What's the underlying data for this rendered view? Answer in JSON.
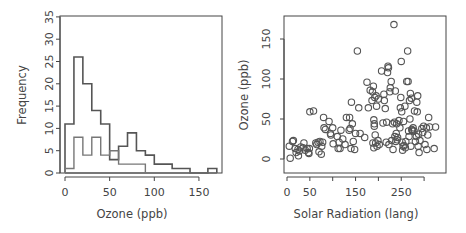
{
  "chart_data": [
    {
      "type": "bar",
      "subtype": "overlaid step histograms",
      "title": "",
      "xlabel": "Ozone (ppb)",
      "ylabel": "Frequency",
      "xlim": [
        0,
        170
      ],
      "ylim": [
        0,
        35
      ],
      "x_ticks": [
        0,
        50,
        100,
        150
      ],
      "y_ticks": [
        0,
        5,
        10,
        15,
        20,
        25,
        30,
        35
      ],
      "bin_width": 10,
      "bin_edges": [
        0,
        10,
        20,
        30,
        40,
        50,
        60,
        70,
        80,
        90,
        100,
        110,
        120,
        130,
        140,
        150,
        160,
        170
      ],
      "series": [
        {
          "name": "all",
          "color": "#555555",
          "values": [
            11,
            26,
            20,
            14,
            11,
            3,
            6,
            9,
            5,
            4,
            2,
            2,
            1,
            1,
            0,
            0,
            1
          ]
        },
        {
          "name": "subset",
          "color": "#777777",
          "values": [
            1,
            8,
            4,
            8,
            4,
            5,
            2,
            2,
            2,
            0,
            0,
            0,
            0,
            0,
            0,
            0,
            0
          ]
        }
      ],
      "grid": false,
      "legend": null
    },
    {
      "type": "scatter",
      "title": "",
      "xlabel": "Solar Radiation (lang)",
      "ylabel": "Ozone (ppb)",
      "xlim": [
        0,
        335
      ],
      "ylim": [
        -15,
        175
      ],
      "x_ticks": [
        0,
        50,
        100,
        150,
        200,
        250,
        300
      ],
      "x_tick_labels": [
        "0",
        "50",
        "",
        "150",
        "",
        "250",
        ""
      ],
      "y_ticks": [
        0,
        50,
        100,
        150
      ],
      "marker": "open circle",
      "color": "#555555",
      "grid": false,
      "points": [
        [
          7,
          1
        ],
        [
          5,
          16
        ],
        [
          14,
          23
        ],
        [
          12,
          22
        ],
        [
          18,
          13
        ],
        [
          20,
          8
        ],
        [
          25,
          4
        ],
        [
          24,
          12
        ],
        [
          27,
          10
        ],
        [
          30,
          15
        ],
        [
          35,
          14
        ],
        [
          37,
          20
        ],
        [
          40,
          11
        ],
        [
          44,
          13
        ],
        [
          47,
          8
        ],
        [
          48,
          7
        ],
        [
          49,
          13
        ],
        [
          50,
          59
        ],
        [
          58,
          60
        ],
        [
          63,
          20
        ],
        [
          65,
          18
        ],
        [
          68,
          21
        ],
        [
          70,
          9
        ],
        [
          72,
          22
        ],
        [
          75,
          6
        ],
        [
          76,
          16
        ],
        [
          78,
          21
        ],
        [
          80,
          52
        ],
        [
          81,
          39
        ],
        [
          84,
          37
        ],
        [
          92,
          47
        ],
        [
          95,
          32
        ],
        [
          96,
          30
        ],
        [
          100,
          39
        ],
        [
          101,
          19
        ],
        [
          110,
          28
        ],
        [
          112,
          13
        ],
        [
          114,
          21
        ],
        [
          116,
          13
        ],
        [
          118,
          36
        ],
        [
          122,
          25
        ],
        [
          127,
          18
        ],
        [
          130,
          52
        ],
        [
          136,
          36
        ],
        [
          137,
          52
        ],
        [
          138,
          38
        ],
        [
          140,
          13
        ],
        [
          141,
          71
        ],
        [
          143,
          44
        ],
        [
          145,
          22
        ],
        [
          148,
          12
        ],
        [
          150,
          32
        ],
        [
          154,
          135
        ],
        [
          157,
          64
        ],
        [
          160,
          32
        ],
        [
          170,
          27
        ],
        [
          175,
          96
        ],
        [
          178,
          64
        ],
        [
          182,
          86
        ],
        [
          186,
          73
        ],
        [
          187,
          84
        ],
        [
          188,
          20
        ],
        [
          189,
          91
        ],
        [
          190,
          49
        ],
        [
          190,
          14
        ],
        [
          191,
          41
        ],
        [
          191,
          44
        ],
        [
          192,
          77
        ],
        [
          193,
          30
        ],
        [
          194,
          20
        ],
        [
          195,
          79
        ],
        [
          196,
          66
        ],
        [
          197,
          16
        ],
        [
          199,
          23
        ],
        [
          200,
          75
        ],
        [
          202,
          18
        ],
        [
          207,
          110
        ],
        [
          210,
          45
        ],
        [
          212,
          81
        ],
        [
          213,
          73
        ],
        [
          215,
          63
        ],
        [
          217,
          21
        ],
        [
          218,
          46
        ],
        [
          220,
          108
        ],
        [
          221,
          116
        ],
        [
          222,
          114
        ],
        [
          223,
          18
        ],
        [
          225,
          84
        ],
        [
          226,
          89
        ],
        [
          228,
          97
        ],
        [
          229,
          23
        ],
        [
          231,
          44
        ],
        [
          232,
          12
        ],
        [
          234,
          168
        ],
        [
          235,
          46
        ],
        [
          236,
          28
        ],
        [
          237,
          85
        ],
        [
          238,
          22
        ],
        [
          239,
          32
        ],
        [
          240,
          44
        ],
        [
          241,
          24
        ],
        [
          242,
          27
        ],
        [
          245,
          48
        ],
        [
          247,
          39
        ],
        [
          248,
          64
        ],
        [
          249,
          77
        ],
        [
          250,
          122
        ],
        [
          251,
          59
        ],
        [
          252,
          21
        ],
        [
          253,
          11
        ],
        [
          254,
          16
        ],
        [
          255,
          47
        ],
        [
          256,
          17
        ],
        [
          258,
          66
        ],
        [
          259,
          14
        ],
        [
          260,
          22
        ],
        [
          262,
          97
        ],
        [
          264,
          135
        ],
        [
          265,
          97
        ],
        [
          266,
          35
        ],
        [
          267,
          28
        ],
        [
          268,
          73
        ],
        [
          269,
          50
        ],
        [
          270,
          82
        ],
        [
          271,
          16
        ],
        [
          272,
          76
        ],
        [
          273,
          37
        ],
        [
          274,
          36
        ],
        [
          275,
          35
        ],
        [
          276,
          39
        ],
        [
          278,
          35
        ],
        [
          279,
          60
        ],
        [
          281,
          22
        ],
        [
          283,
          28
        ],
        [
          284,
          71
        ],
        [
          285,
          59
        ],
        [
          286,
          79
        ],
        [
          287,
          16
        ],
        [
          288,
          31
        ],
        [
          289,
          8
        ],
        [
          291,
          23
        ],
        [
          295,
          38
        ],
        [
          297,
          33
        ],
        [
          299,
          41
        ],
        [
          302,
          18
        ],
        [
          305,
          39
        ],
        [
          306,
          12
        ],
        [
          308,
          30
        ],
        [
          310,
          52
        ],
        [
          312,
          40
        ],
        [
          322,
          13
        ],
        [
          325,
          40
        ]
      ]
    }
  ],
  "panels": {
    "left": {
      "ylabel": "Frequency",
      "xlabel": "Ozone (ppb)",
      "y_tick_labels": [
        "0",
        "5",
        "10",
        "15",
        "20",
        "25",
        "30",
        "35"
      ],
      "x_tick_labels": [
        "0",
        "50",
        "100",
        "150"
      ]
    },
    "right": {
      "ylabel": "Ozone (ppb)",
      "xlabel": "Solar Radiation (lang)",
      "y_tick_labels": [
        "0",
        "50",
        "100",
        "150"
      ],
      "x_tick_labels": [
        "0",
        "50",
        "150",
        "250"
      ]
    }
  }
}
